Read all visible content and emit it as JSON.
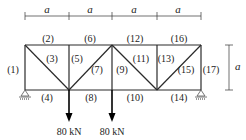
{
  "diagram": {
    "type": "truss",
    "dimension_label": "a",
    "span_labels": [
      "a",
      "a",
      "a",
      "a"
    ],
    "height_label": "a",
    "members": [
      {
        "id": "1",
        "label": "(1)"
      },
      {
        "id": "2",
        "label": "(2)"
      },
      {
        "id": "3",
        "label": "(3)"
      },
      {
        "id": "4",
        "label": "(4)"
      },
      {
        "id": "5",
        "label": "(5)"
      },
      {
        "id": "6",
        "label": "(6)"
      },
      {
        "id": "7",
        "label": "(7)"
      },
      {
        "id": "8",
        "label": "(8)"
      },
      {
        "id": "9",
        "label": "(9)"
      },
      {
        "id": "10",
        "label": "(10)"
      },
      {
        "id": "11",
        "label": "(11)"
      },
      {
        "id": "12",
        "label": "(12)"
      },
      {
        "id": "13",
        "label": "(13)"
      },
      {
        "id": "14",
        "label": "(14)"
      },
      {
        "id": "15",
        "label": "(15)"
      },
      {
        "id": "16",
        "label": "(16)"
      },
      {
        "id": "17",
        "label": "(17)"
      }
    ],
    "loads": [
      {
        "label": "80 kN"
      },
      {
        "label": "80 kN"
      }
    ],
    "supports": [
      "pin-left",
      "roller-right"
    ]
  }
}
